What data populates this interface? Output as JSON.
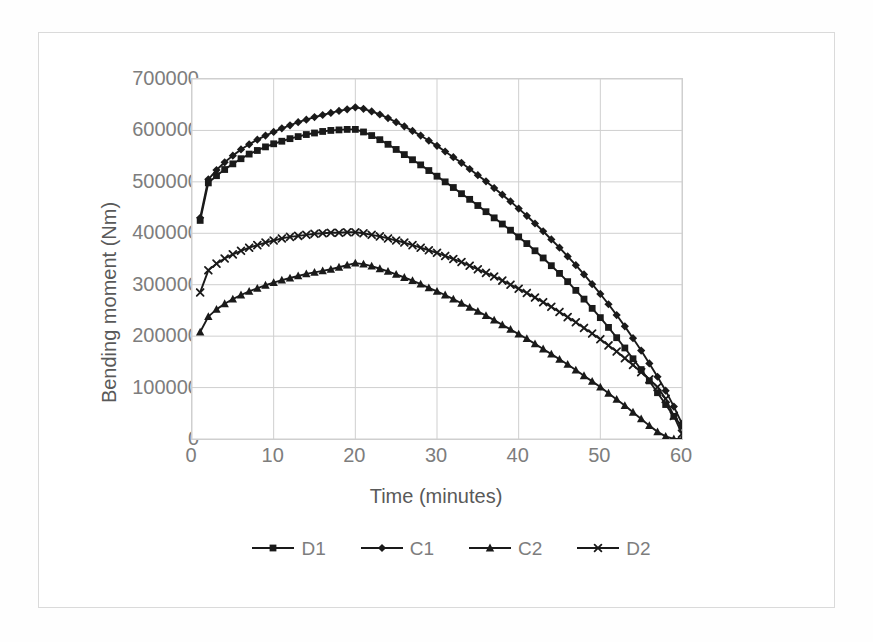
{
  "chart_data": {
    "type": "line",
    "title": "",
    "xlabel": "Time (minutes)",
    "ylabel": "Bending moment (Nm)",
    "xlim": [
      0,
      60
    ],
    "ylim": [
      0,
      700000
    ],
    "xticks": [
      0,
      10,
      20,
      30,
      40,
      50,
      60
    ],
    "yticks": [
      0,
      100000,
      200000,
      300000,
      400000,
      500000,
      600000,
      700000
    ],
    "grid": true,
    "legend_position": "bottom",
    "legend": [
      "D1",
      "C1",
      "C2",
      "D2"
    ],
    "markers": {
      "D1": "square",
      "C1": "diamond",
      "C2": "triangle",
      "D2": "x"
    },
    "line_color": "#1a1a1a",
    "grid_color": "#cfcfcf",
    "x": [
      1,
      2,
      3,
      4,
      5,
      6,
      7,
      8,
      9,
      10,
      11,
      12,
      13,
      14,
      15,
      16,
      17,
      18,
      19,
      20,
      21,
      22,
      23,
      24,
      25,
      26,
      27,
      28,
      29,
      30,
      31,
      32,
      33,
      34,
      35,
      36,
      37,
      38,
      39,
      40,
      41,
      42,
      43,
      44,
      45,
      46,
      47,
      48,
      49,
      50,
      51,
      52,
      53,
      54,
      55,
      56,
      57,
      58,
      59,
      60
    ],
    "series": [
      {
        "name": "D1",
        "marker": "square",
        "values": [
          425000,
          498000,
          512000,
          524000,
          535000,
          545000,
          554000,
          561000,
          568000,
          574000,
          579000,
          584000,
          588000,
          592000,
          595000,
          598000,
          600000,
          601000,
          602000,
          602000,
          597000,
          590000,
          582000,
          573000,
          563000,
          553000,
          543000,
          533000,
          522000,
          511000,
          500000,
          489000,
          477000,
          466000,
          454000,
          442000,
          430000,
          418000,
          406000,
          393000,
          380000,
          366000,
          352000,
          337000,
          322000,
          306000,
          289000,
          272000,
          254000,
          236000,
          217000,
          197000,
          177000,
          156000,
          135000,
          113000,
          90000,
          67000,
          44000,
          25000
        ]
      },
      {
        "name": "C1",
        "marker": "diamond",
        "values": [
          430000,
          505000,
          523000,
          538000,
          551000,
          563000,
          573000,
          582000,
          590000,
          597000,
          604000,
          610000,
          616000,
          621000,
          626000,
          630000,
          634000,
          638000,
          641000,
          645000,
          642000,
          637000,
          631000,
          624000,
          616000,
          608000,
          599000,
          590000,
          580000,
          570000,
          559000,
          548000,
          537000,
          525000,
          513000,
          501000,
          488000,
          475000,
          462000,
          448000,
          434000,
          419000,
          404000,
          388000,
          372000,
          355000,
          338000,
          320000,
          301000,
          282000,
          262000,
          241000,
          219000,
          196000,
          172000,
          147000,
          121000,
          94000,
          63000,
          30000
        ]
      },
      {
        "name": "C2",
        "marker": "triangle",
        "values": [
          208000,
          238000,
          252000,
          263000,
          272000,
          280000,
          287000,
          293000,
          299000,
          304000,
          309000,
          313000,
          317000,
          321000,
          324000,
          327000,
          330000,
          334000,
          338000,
          342000,
          340000,
          336000,
          331000,
          326000,
          320000,
          314000,
          308000,
          301000,
          294000,
          287000,
          280000,
          272000,
          264000,
          256000,
          248000,
          240000,
          231000,
          222000,
          213000,
          204000,
          195000,
          185000,
          175000,
          165000,
          155000,
          145000,
          134000,
          123000,
          112000,
          101000,
          89000,
          77000,
          65000,
          52000,
          39000,
          26000,
          14000,
          5000,
          0,
          0
        ]
      },
      {
        "name": "D2",
        "marker": "x",
        "values": [
          285000,
          328000,
          341000,
          351000,
          359000,
          366000,
          372000,
          377000,
          382000,
          386000,
          390000,
          393000,
          395000,
          397000,
          399000,
          400000,
          401000,
          401000,
          402000,
          402000,
          400000,
          397000,
          394000,
          390000,
          386000,
          382000,
          377000,
          372000,
          367000,
          362000,
          356000,
          350000,
          344000,
          337000,
          330000,
          323000,
          316000,
          308000,
          300000,
          292000,
          284000,
          275000,
          266000,
          257000,
          247000,
          237000,
          227000,
          216000,
          205000,
          194000,
          182000,
          170000,
          157000,
          144000,
          130000,
          116000,
          101000,
          78000,
          45000,
          10000
        ]
      }
    ]
  },
  "axes": {
    "y_tick_labels": [
      "700000",
      "600000",
      "500000",
      "400000",
      "300000",
      "200000",
      "100000",
      "0"
    ],
    "x_tick_labels": [
      "0",
      "10",
      "20",
      "30",
      "40",
      "50",
      "60"
    ]
  }
}
